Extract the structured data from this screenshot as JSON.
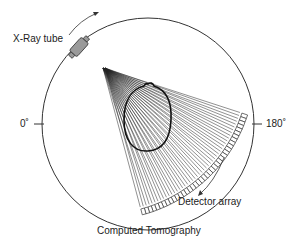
{
  "diagram": {
    "title": "Computed Tomography",
    "labels": {
      "xray_tube": "X-Ray tube",
      "detector_array": "Detector array",
      "angle_left": "0˚",
      "angle_right": "180˚"
    },
    "colors": {
      "line": "#333333",
      "tube_fill": "#9a9a9a",
      "background": "#ffffff"
    }
  }
}
